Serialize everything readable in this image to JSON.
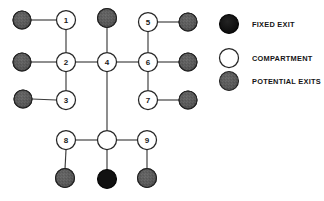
{
  "diagram": {
    "background_color": "#ffffff",
    "edge_color": "#3a3a3a",
    "node_colors": {
      "fixed_exit": "#111111",
      "compartment": "#ffffff",
      "compartment_stroke": "#262626",
      "potential_exit": "#5a5a5a"
    },
    "compartments": [
      {
        "id": "c1",
        "label": "1",
        "x": 66,
        "y": 20,
        "r": 9.5
      },
      {
        "id": "c2",
        "label": "2",
        "x": 66,
        "y": 62,
        "r": 9.5
      },
      {
        "id": "c3",
        "label": "3",
        "x": 66,
        "y": 100,
        "r": 9.5
      },
      {
        "id": "c4",
        "label": "4",
        "x": 107,
        "y": 62,
        "r": 9.5
      },
      {
        "id": "c5",
        "label": "5",
        "x": 148,
        "y": 22,
        "r": 9.5
      },
      {
        "id": "c6",
        "label": "6",
        "x": 148,
        "y": 62,
        "r": 9.5
      },
      {
        "id": "c7",
        "label": "7",
        "x": 148,
        "y": 100,
        "r": 9.5
      },
      {
        "id": "c8",
        "label": "8",
        "x": 66,
        "y": 140,
        "r": 9.5
      },
      {
        "id": "c9",
        "label": "9",
        "x": 147,
        "y": 140,
        "r": 9.5
      },
      {
        "id": "c10",
        "label": "",
        "x": 107,
        "y": 140,
        "r": 9.5
      }
    ],
    "potential_exits": [
      {
        "id": "p1",
        "x": 22,
        "y": 20,
        "r": 9
      },
      {
        "id": "p2",
        "x": 22,
        "y": 62,
        "r": 9
      },
      {
        "id": "p3",
        "x": 23,
        "y": 99,
        "r": 9
      },
      {
        "id": "p4",
        "x": 107,
        "y": 18,
        "r": 9.5
      },
      {
        "id": "p5",
        "x": 188,
        "y": 22,
        "r": 9
      },
      {
        "id": "p6",
        "x": 188,
        "y": 62,
        "r": 9
      },
      {
        "id": "p7",
        "x": 188,
        "y": 100,
        "r": 9
      },
      {
        "id": "p8",
        "x": 65,
        "y": 178,
        "r": 9.5
      },
      {
        "id": "p9",
        "x": 147,
        "y": 178,
        "r": 9.5
      }
    ],
    "fixed_exits": [
      {
        "id": "f1",
        "x": 107,
        "y": 179,
        "r": 9.5
      }
    ],
    "edges": [
      {
        "from": "p1",
        "to": "c1",
        "x1": 31,
        "y1": 20,
        "x2": 56,
        "y2": 20
      },
      {
        "from": "c1",
        "to": "c2",
        "x1": 66,
        "y1": 30,
        "x2": 66,
        "y2": 52
      },
      {
        "from": "p2",
        "to": "c2",
        "x1": 31,
        "y1": 62,
        "x2": 56,
        "y2": 62
      },
      {
        "from": "c2",
        "to": "c4",
        "x1": 76,
        "y1": 62,
        "x2": 97,
        "y2": 62
      },
      {
        "from": "c2",
        "to": "c3",
        "x1": 66,
        "y1": 72,
        "x2": 66,
        "y2": 90
      },
      {
        "from": "p3",
        "to": "c3",
        "x1": 32,
        "y1": 99,
        "x2": 56,
        "y2": 100
      },
      {
        "from": "p4",
        "to": "c4",
        "x1": 107,
        "y1": 28,
        "x2": 107,
        "y2": 52
      },
      {
        "from": "c4",
        "to": "c6",
        "x1": 117,
        "y1": 62,
        "x2": 138,
        "y2": 62
      },
      {
        "from": "c4",
        "to": "c10",
        "x1": 107,
        "y1": 72,
        "x2": 107,
        "y2": 130
      },
      {
        "from": "c5",
        "to": "p5",
        "x1": 158,
        "y1": 22,
        "x2": 179,
        "y2": 22
      },
      {
        "from": "c5",
        "to": "c6",
        "x1": 148,
        "y1": 32,
        "x2": 148,
        "y2": 52
      },
      {
        "from": "c6",
        "to": "p6",
        "x1": 158,
        "y1": 62,
        "x2": 179,
        "y2": 62
      },
      {
        "from": "c6",
        "to": "c7",
        "x1": 148,
        "y1": 72,
        "x2": 148,
        "y2": 90
      },
      {
        "from": "c7",
        "to": "p7",
        "x1": 158,
        "y1": 100,
        "x2": 179,
        "y2": 100
      },
      {
        "from": "c8",
        "to": "c10",
        "x1": 76,
        "y1": 140,
        "x2": 97,
        "y2": 140
      },
      {
        "from": "c8",
        "to": "p8",
        "x1": 66,
        "y1": 150,
        "x2": 65,
        "y2": 169
      },
      {
        "from": "c10",
        "to": "f1",
        "x1": 107,
        "y1": 150,
        "x2": 107,
        "y2": 170
      },
      {
        "from": "c10",
        "to": "c9",
        "x1": 117,
        "y1": 140,
        "x2": 137,
        "y2": 140
      },
      {
        "from": "c9",
        "to": "p9",
        "x1": 147,
        "y1": 150,
        "x2": 147,
        "y2": 169
      }
    ]
  },
  "legend": {
    "items": [
      {
        "id": "legend-fixed-exit",
        "label": "FIXED EXIT",
        "symbol": "fixed-exit-circle",
        "cx": 229,
        "cy": 24,
        "r": 9.5,
        "text_x": 252
      },
      {
        "id": "legend-compartment",
        "label": "COMPARTMENT",
        "symbol": "compartment-circle",
        "cx": 229,
        "cy": 58,
        "r": 9.5,
        "text_x": 252
      },
      {
        "id": "legend-potential-exits",
        "label": "POTENTIAL EXITS",
        "symbol": "potential-exit-circle",
        "cx": 229,
        "cy": 81,
        "r": 9.5,
        "text_x": 252
      }
    ]
  }
}
